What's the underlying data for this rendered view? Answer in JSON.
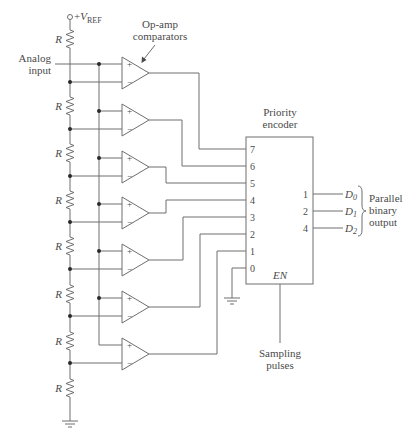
{
  "diagram": {
    "vref": {
      "prefix": "+",
      "symbol": "V",
      "subscript": "REF"
    },
    "analog_input_label": [
      "Analog",
      "input"
    ],
    "comparators_label": [
      "Op-amp",
      "comparators"
    ],
    "resistors": [
      "R",
      "R",
      "R",
      "R",
      "R",
      "R",
      "R",
      "R"
    ],
    "comparator_signs": {
      "plus": "+",
      "minus": "−"
    },
    "comparator_count": 7,
    "encoder": {
      "title_lines": [
        "Priority",
        "encoder"
      ],
      "input_pins": [
        "7",
        "6",
        "5",
        "4",
        "3",
        "2",
        "1",
        "0"
      ],
      "output_pins": [
        "1",
        "2",
        "4"
      ],
      "enable_label": "EN"
    },
    "outputs": [
      {
        "name": "D",
        "sub": "0"
      },
      {
        "name": "D",
        "sub": "1"
      },
      {
        "name": "D",
        "sub": "2"
      }
    ],
    "output_group_label": [
      "Parallel",
      "binary",
      "output"
    ],
    "sampling_label": [
      "Sampling",
      "pulses"
    ]
  }
}
